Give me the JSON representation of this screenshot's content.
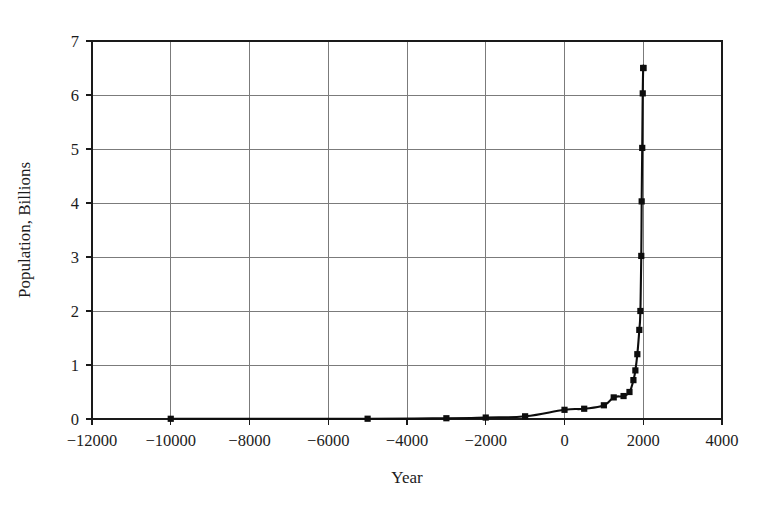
{
  "chart_data": {
    "type": "line",
    "title": "",
    "xlabel": "Year",
    "ylabel": "Population, Billions",
    "xlim": [
      -12000,
      4000
    ],
    "ylim": [
      0,
      7
    ],
    "grid": true,
    "legend": false,
    "marker": "square",
    "line_color": "#0d0d0d",
    "grid_color": "#7b7b7b",
    "xticks": [
      -12000,
      -10000,
      -8000,
      -6000,
      -4000,
      -2000,
      0,
      2000,
      4000
    ],
    "xtick_labels": [
      "−12000",
      "−10000",
      "−8000",
      "−6000",
      "−4000",
      "−2000",
      "0",
      "2000",
      "4000"
    ],
    "yticks": [
      0,
      1,
      2,
      3,
      4,
      5,
      6,
      7
    ],
    "ytick_labels": [
      "0",
      "1",
      "2",
      "3",
      "4",
      "5",
      "6",
      "7"
    ],
    "x": [
      -10000,
      -5000,
      -3000,
      -2000,
      -1000,
      0,
      500,
      1000,
      1250,
      1500,
      1650,
      1750,
      1800,
      1850,
      1900,
      1927,
      1950,
      1960,
      1974,
      1987,
      1999,
      2005
    ],
    "y": [
      0.004,
      0.005,
      0.014,
      0.027,
      0.05,
      0.17,
      0.19,
      0.254,
      0.4,
      0.425,
      0.5,
      0.72,
      0.9,
      1.2,
      1.65,
      2.0,
      3.02,
      4.03,
      5.02,
      6.03,
      6.5,
      6.5
    ],
    "series": [
      {
        "name": "World population",
        "values": [
          0.004,
          0.005,
          0.014,
          0.027,
          0.05,
          0.17,
          0.19,
          0.254,
          0.4,
          0.425,
          0.5,
          0.72,
          0.9,
          1.2,
          1.65,
          2.0,
          3.02,
          4.03,
          5.02,
          6.03,
          6.5,
          6.5
        ]
      }
    ]
  }
}
